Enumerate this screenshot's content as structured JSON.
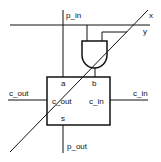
{
  "diagram": {
    "type": "circuit-schematic",
    "wires": {
      "p_in": "p_in",
      "x": "x",
      "y": "y",
      "c_out_left": "c_out",
      "c_in_right": "c_in",
      "p_out": "p_out"
    },
    "box_ports": {
      "a": "a",
      "b": "b",
      "c_out": "c_out",
      "c_in": "c_in",
      "s": "s"
    },
    "gate": "AND",
    "colors": {
      "stroke": "#111111",
      "background": "#ffffff"
    }
  }
}
